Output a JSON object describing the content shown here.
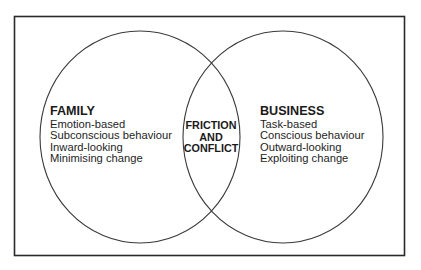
{
  "diagram": {
    "type": "venn",
    "left_set": {
      "title": "FAMILY",
      "items": [
        "Emotion-based",
        "Subconscious behaviour",
        "Inward-looking",
        "Minimising change"
      ]
    },
    "right_set": {
      "title": "BUSINESS",
      "items": [
        "Task-based",
        "Conscious behaviour",
        "Outward-looking",
        "Exploiting change"
      ]
    },
    "intersection": {
      "lines": [
        "FRICTION",
        "AND",
        "CONFLICT"
      ]
    },
    "colors": {
      "stroke": "#2a2a2a",
      "text": "#1e1e1e",
      "background": "#ffffff"
    }
  }
}
